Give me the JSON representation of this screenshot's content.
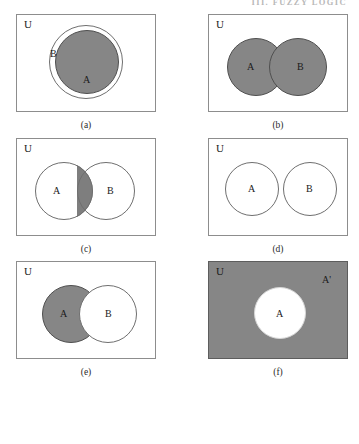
{
  "header": {
    "running_head": "III. FUZZY LOGIC"
  },
  "figure": {
    "universe_label": "U",
    "complement_label": "A'",
    "panels": [
      {
        "caption": "(a)",
        "description": "A is a proper subset of B; region A shaded",
        "labels": {
          "outer": "B",
          "inner": "A"
        }
      },
      {
        "caption": "(b)",
        "description": "Union of A and B; both circles shaded",
        "labels": {
          "left": "A",
          "right": "B"
        }
      },
      {
        "caption": "(c)",
        "description": "Intersection of A and B; overlapping lens shaded",
        "labels": {
          "left": "A",
          "right": "B"
        }
      },
      {
        "caption": "(d)",
        "description": "A and B are disjoint; nothing shaded",
        "labels": {
          "left": "A",
          "right": "B"
        }
      },
      {
        "caption": "(e)",
        "description": "Difference A minus B; only A region shaded",
        "labels": {
          "left": "A",
          "right": "B"
        }
      },
      {
        "caption": "(f)",
        "description": "Complement of A; universe shaded, A white",
        "labels": {
          "center": "A",
          "complement": "A'"
        }
      }
    ],
    "colors": {
      "shade_gray": "#868686",
      "outline": "#6f6f6f",
      "box_border": "#8d8d8d",
      "background": "#ffffff"
    }
  }
}
